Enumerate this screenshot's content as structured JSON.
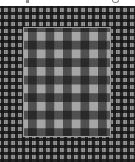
{
  "image": {
    "description": "Gingham checkered fabric swatch: a small-scale gray/black check background with a larger-scale gray/black check rectangle inset in the center",
    "top_text_visible": false
  },
  "colors": {
    "background": "#ffffff",
    "outer_check_base": "#7a7a7a",
    "outer_check_dark": "#141414",
    "inner_check_base": "#a5a5a5",
    "inner_check_dark": "#0a0a0a",
    "inner_border": "#9a9a9a"
  },
  "layout": {
    "outer_check_period_px": 7,
    "inner_check_period_px": 17.5,
    "inner_rect": {
      "x": 24,
      "y": 28,
      "width": 86,
      "height": 108
    }
  }
}
